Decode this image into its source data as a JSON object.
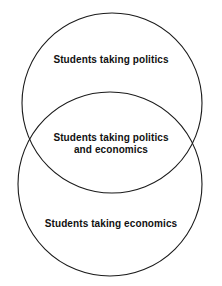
{
  "diagram": {
    "type": "venn",
    "background_color": "#ffffff",
    "stroke_color": "#1a1a1a",
    "text_color": "#111111",
    "canvas": {
      "width": 222,
      "height": 286
    },
    "sets": [
      {
        "id": "politics",
        "label": "Students taking politics",
        "shape": "circle",
        "cx": 112,
        "cy": 103,
        "r": 90
      },
      {
        "id": "economics",
        "label": "Students taking economics",
        "shape": "circle",
        "cx": 110,
        "cy": 184,
        "r": 92
      }
    ],
    "intersection": {
      "id": "politics-and-economics",
      "label_line_1": "Students taking politics",
      "label_line_2": "and economics"
    }
  }
}
